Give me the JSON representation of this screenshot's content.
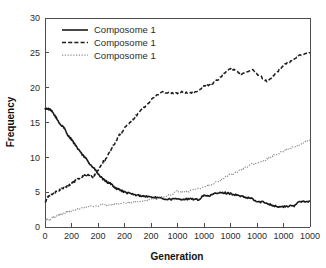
{
  "chart_data": {
    "type": "line",
    "title": "",
    "xlabel": "Generation",
    "ylabel": "Frequency",
    "xlim": [
      0,
      10000
    ],
    "ylim": [
      0,
      30
    ],
    "grid": false,
    "legend_position": "top-left-inset",
    "x_tick_labels": [
      "0",
      "200",
      "200",
      "200",
      "200",
      "1000",
      "1000",
      "1000",
      "1000",
      "1000",
      "1000"
    ],
    "x_tick_positions": [
      0,
      1000,
      2000,
      3000,
      4000,
      5000,
      6000,
      7000,
      8000,
      9000,
      10000
    ],
    "y_tick_labels": [
      "0",
      "5",
      "10",
      "15",
      "20",
      "25",
      "30"
    ],
    "y_tick_positions": [
      0,
      5,
      10,
      15,
      20,
      25,
      30
    ],
    "series": [
      {
        "name": "Composome 1",
        "style": "solid",
        "color": "#1a1a1a",
        "x": [
          0,
          100,
          200,
          300,
          400,
          500,
          600,
          700,
          800,
          900,
          1000,
          1100,
          1200,
          1300,
          1400,
          1500,
          1600,
          1700,
          1800,
          1900,
          2000,
          2100,
          2200,
          2300,
          2400,
          2500,
          2600,
          2700,
          2800,
          2900,
          3000,
          3200,
          3400,
          3600,
          3800,
          4000,
          4200,
          4400,
          4600,
          4800,
          5000,
          5200,
          5400,
          5600,
          5800,
          6000,
          6200,
          6400,
          6600,
          6800,
          7000,
          7200,
          7400,
          7600,
          7800,
          8000,
          8200,
          8400,
          8600,
          8800,
          9000,
          9200,
          9400,
          9600,
          9800,
          10000
        ],
        "y": [
          17.0,
          17.0,
          16.8,
          16.4,
          15.8,
          15.2,
          14.6,
          14.4,
          13.6,
          13.0,
          12.6,
          12.0,
          11.4,
          11.0,
          10.4,
          10.0,
          9.6,
          9.0,
          8.6,
          8.2,
          7.6,
          7.2,
          6.8,
          6.6,
          6.3,
          6.2,
          5.8,
          5.5,
          5.4,
          5.2,
          5.0,
          4.8,
          4.6,
          4.5,
          4.4,
          4.3,
          4.2,
          4.1,
          4.0,
          4.0,
          4.0,
          4.0,
          4.0,
          4.0,
          3.9,
          4.6,
          4.4,
          4.8,
          4.9,
          4.9,
          4.8,
          4.6,
          4.4,
          4.2,
          4.1,
          3.6,
          3.6,
          3.4,
          3.1,
          2.9,
          2.9,
          3.0,
          3.0,
          3.7,
          3.7,
          3.7
        ]
      },
      {
        "name": "Composome 1",
        "style": "dashed",
        "color": "#1a1a1a",
        "x": [
          0,
          100,
          200,
          300,
          400,
          500,
          600,
          700,
          800,
          900,
          1000,
          1100,
          1200,
          1300,
          1400,
          1500,
          1600,
          1700,
          1800,
          1900,
          2000,
          2100,
          2200,
          2300,
          2400,
          2500,
          2600,
          2700,
          2800,
          2900,
          3000,
          3200,
          3400,
          3600,
          3800,
          4000,
          4200,
          4400,
          4600,
          4800,
          5000,
          5200,
          5400,
          5600,
          5800,
          6000,
          6200,
          6400,
          6600,
          6800,
          7000,
          7200,
          7400,
          7600,
          7800,
          8000,
          8200,
          8400,
          8600,
          8800,
          9000,
          9200,
          9400,
          9600,
          9800,
          10000
        ],
        "y": [
          3.5,
          4.3,
          4.6,
          4.8,
          5.0,
          5.2,
          5.4,
          5.6,
          5.8,
          6.0,
          6.2,
          6.5,
          6.8,
          7.0,
          7.2,
          7.4,
          7.5,
          7.3,
          7.2,
          7.6,
          8.2,
          8.8,
          9.4,
          9.8,
          10.6,
          11.2,
          11.8,
          12.4,
          13.2,
          13.6,
          14.2,
          15.0,
          15.8,
          16.6,
          17.4,
          18.2,
          18.8,
          19.4,
          19.3,
          19.2,
          19.2,
          19.4,
          19.2,
          19.4,
          19.6,
          20.2,
          20.4,
          20.8,
          21.4,
          22.2,
          22.8,
          22.4,
          22.0,
          22.2,
          22.6,
          22.0,
          21.4,
          20.8,
          21.6,
          22.4,
          23.2,
          23.6,
          24.0,
          24.6,
          24.9,
          25.0
        ]
      },
      {
        "name": "Composome 1",
        "style": "dotted",
        "color": "#8c8c8c",
        "x": [
          0,
          100,
          200,
          300,
          400,
          500,
          600,
          700,
          800,
          900,
          1000,
          1200,
          1400,
          1600,
          1800,
          2000,
          2200,
          2400,
          2600,
          2800,
          3000,
          3200,
          3400,
          3600,
          3800,
          4000,
          4200,
          4400,
          4600,
          4800,
          5000,
          5200,
          5400,
          5600,
          5800,
          6000,
          6200,
          6400,
          6600,
          6800,
          7000,
          7200,
          7400,
          7600,
          7800,
          8000,
          8200,
          8400,
          8600,
          8800,
          9000,
          9200,
          9400,
          9600,
          9800,
          10000
        ],
        "y": [
          1.0,
          1.0,
          1.1,
          1.3,
          1.5,
          1.7,
          1.8,
          1.9,
          2.1,
          2.2,
          2.3,
          2.5,
          2.7,
          2.9,
          3.0,
          3.1,
          3.2,
          3.2,
          3.3,
          3.3,
          3.4,
          3.5,
          3.6,
          3.7,
          3.8,
          4.0,
          4.1,
          4.3,
          4.5,
          4.7,
          5.2,
          5.0,
          5.1,
          5.3,
          5.5,
          5.7,
          6.0,
          6.3,
          6.6,
          7.2,
          7.5,
          7.8,
          8.2,
          8.6,
          9.0,
          9.2,
          9.4,
          9.8,
          10.2,
          10.6,
          10.9,
          11.2,
          11.5,
          11.8,
          12.2,
          12.5
        ]
      }
    ]
  },
  "legend": {
    "entries": [
      {
        "label": "Composome 1",
        "style": "solid",
        "color": "#1a1a1a"
      },
      {
        "label": "Composome 1",
        "style": "dashed",
        "color": "#1a1a1a"
      },
      {
        "label": "Composome 1",
        "style": "dotted",
        "color": "#8c8c8c"
      }
    ]
  },
  "colors": {
    "background": "#ffffff",
    "axis": "#4d4d4d",
    "text": "#1a1a1a",
    "series_solid": "#1a1a1a",
    "series_dashed": "#1a1a1a",
    "series_dotted": "#8c8c8c"
  }
}
